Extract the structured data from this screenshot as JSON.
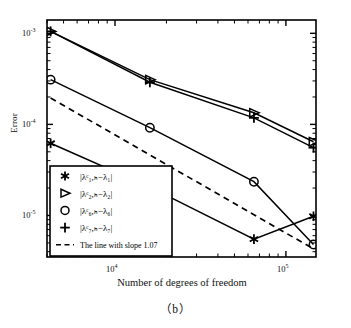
{
  "caption": "（b）",
  "chart_data": {
    "type": "line",
    "title": "",
    "subtitle": "",
    "xlabel": "Number of degrees of freedom",
    "ylabel": "Error",
    "xscale": "log",
    "yscale": "log",
    "xlim": [
      4000,
      150000
    ],
    "ylim": [
      3.5e-06,
      0.0014
    ],
    "grid": false,
    "legend_position": "lower-left-inside",
    "xticks": [
      {
        "value": 10000,
        "label": "10",
        "exponent": "4"
      },
      {
        "value": 100000,
        "label": "10",
        "exponent": "5"
      }
    ],
    "yticks": [
      {
        "value": 0.001,
        "label": "10",
        "exponent": "-3"
      },
      {
        "value": 0.0001,
        "label": "10",
        "exponent": "-4"
      },
      {
        "value": 1e-05,
        "label": "10",
        "exponent": "-5"
      }
    ],
    "x": [
      4200,
      16000,
      65000,
      145000
    ],
    "series": [
      {
        "name": "|λ³₁,ₕ − λ₁|",
        "label_parts": {
          "prefix": "|λ",
          "sup": "c",
          "sub": "1,h",
          "minus": "−λ",
          "sub2": "1",
          "suffix": "|"
        },
        "marker": "asterisk",
        "linestyle": "solid",
        "values": [
          6.2e-05,
          2.05e-05,
          5.5e-06,
          9.8e-06
        ]
      },
      {
        "name": "|λ³₂,ₕ − λ₂|",
        "label_parts": {
          "prefix": "|λ",
          "sup": "c",
          "sub": "2,h",
          "minus": "−λ",
          "sub2": "2",
          "suffix": "|"
        },
        "marker": "triangle-right",
        "linestyle": "solid",
        "values": [
          0.00105,
          0.00031,
          0.000134,
          6.45e-05
        ]
      },
      {
        "name": "|λ³₆,ₕ − λ₆|",
        "label_parts": {
          "prefix": "|λ",
          "sup": "c",
          "sub": "6,h",
          "minus": "−λ",
          "sub2": "6",
          "suffix": "|"
        },
        "marker": "circle",
        "linestyle": "solid",
        "values": [
          0.00031,
          9.2e-05,
          2.35e-05,
          4.8e-06
        ]
      },
      {
        "name": "|λ³₇,ₕ − λ₇|",
        "label_parts": {
          "prefix": "|λ",
          "sup": "c",
          "sub": "7,h",
          "minus": "−λ",
          "sub2": "7",
          "suffix": "|"
        },
        "marker": "plus",
        "linestyle": "solid",
        "values": [
          0.00105,
          0.00029,
          0.000118,
          5.55e-05
        ]
      }
    ],
    "reference_line": {
      "name": "The line with slope  1.07",
      "slope": -1.07,
      "linestyle": "dashed",
      "x": [
        4200,
        145000
      ],
      "values": [
        0.000195,
        4.3e-06
      ]
    },
    "legend": [
      {
        "marker": "asterisk",
        "text": "|λᶜ₁,ₕ−λ₁|"
      },
      {
        "marker": "triangle-right",
        "text": "|λᶜ₂,ₕ−λ₂|"
      },
      {
        "marker": "circle",
        "text": "|λᶜ₆,ₕ−λ₆|"
      },
      {
        "marker": "plus",
        "text": "|λᶜ₇,ₕ−λ₇|"
      },
      {
        "marker": "dashed-line",
        "text": "The line with slope  1.07"
      }
    ],
    "colors": {
      "line": "#000000",
      "axis": "#000000",
      "background": "#ffffff"
    }
  }
}
